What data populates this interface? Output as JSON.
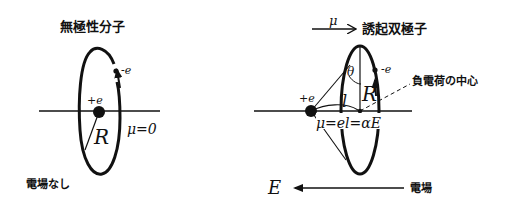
{
  "left_panel": {
    "title": "無極性分子",
    "electron_label": "-e",
    "nucleus_label": "+e",
    "radius_label": "R",
    "dipole_label": "μ=0",
    "field_label": "電場なし"
  },
  "right_panel": {
    "dipole_symbol": "μ",
    "induced_dipole_label": "誘起双極子",
    "electron_label": "-e",
    "nucleus_label": "+e",
    "angle_label": "θ",
    "radius_label": "R",
    "distance_label": "l",
    "negative_center_label": "負電荷の中心",
    "equation": "μ=el=αE",
    "field_symbol": "E",
    "field_label": "電場"
  }
}
